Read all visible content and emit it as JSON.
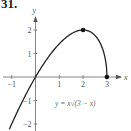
{
  "problem_number": "31.",
  "chart_data": {
    "type": "line",
    "title": "",
    "function_label": "y = x√(3 − x)",
    "xlabel": "x",
    "ylabel": "y",
    "xlim": [
      -1,
      3
    ],
    "ylim": [
      -2.2,
      2.4
    ],
    "x_ticks": [
      -1,
      1,
      2,
      3
    ],
    "x_tick_labels": [
      "−1",
      "1",
      "2",
      "3"
    ],
    "y_ticks": [
      -2,
      -1,
      1,
      2
    ],
    "y_tick_labels": [
      "−2",
      "−1",
      "1",
      "2"
    ],
    "grid": false,
    "legend": "none",
    "series": [
      {
        "name": "y = x√(3 − x)",
        "x": [
          -1.0,
          -0.5,
          0,
          0.5,
          1,
          1.5,
          2,
          2.5,
          2.8,
          2.95,
          3
        ],
        "y": [
          -2.0,
          -0.935,
          0,
          0.791,
          1.414,
          1.837,
          2.0,
          1.768,
          1.252,
          0.659,
          0
        ]
      }
    ],
    "marked_points": [
      {
        "x": 2,
        "y": 2,
        "label": "maximum"
      },
      {
        "x": 3,
        "y": 0,
        "label": "endpoint"
      }
    ]
  },
  "colors": {
    "curve": "#222222",
    "axis": "#555555",
    "text": "#555555"
  }
}
